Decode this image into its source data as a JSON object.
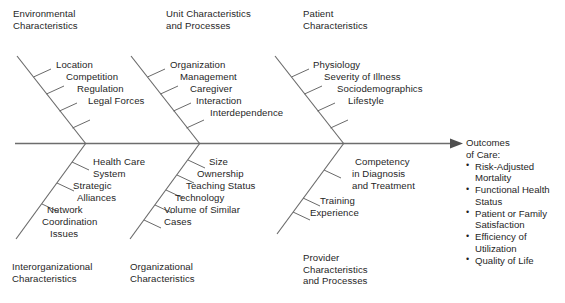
{
  "diagram": {
    "type": "ishikawa-fishbone",
    "line_color": "#6a6a6a",
    "text_color": "#1f1f1f",
    "background_color": "#ffffff"
  },
  "categories": [
    {
      "id": "environmental",
      "position": "top",
      "label_lines": [
        "Environmental",
        "Characteristics"
      ],
      "factor_lines": [
        "Location",
        "Competition",
        "Regulation",
        "Legal Forces"
      ]
    },
    {
      "id": "unit",
      "position": "top",
      "label_lines": [
        "Unit Characteristics",
        "and Processes"
      ],
      "factor_lines": [
        "Organization",
        "Management",
        "Caregiver",
        "Interaction",
        "Interdependence"
      ]
    },
    {
      "id": "patient",
      "position": "top",
      "label_lines": [
        "Patient",
        "Characteristics"
      ],
      "factor_lines": [
        "Physiology",
        "Severity of Illness",
        "Sociodemographics",
        "Lifestyle"
      ]
    },
    {
      "id": "interorganizational",
      "position": "bottom",
      "label_lines": [
        "Interorganizational",
        "Characteristics"
      ],
      "factor_lines": [
        "Health Care",
        "System",
        "Strategic",
        "Alliances",
        "Network",
        "Coordination",
        "Issues"
      ]
    },
    {
      "id": "organizational",
      "position": "bottom",
      "label_lines": [
        "Organizational",
        "Characteristics"
      ],
      "factor_lines": [
        "Size",
        "Ownership",
        "Teaching Status",
        "Technology",
        "Volume of Similar",
        "Cases"
      ]
    },
    {
      "id": "provider",
      "position": "bottom",
      "label_lines": [
        "Provider",
        "Characteristics",
        "and Processes"
      ],
      "factor_lines": [
        "Competency",
        "in Diagnosis",
        "and Treatment",
        "Training",
        "Experience"
      ]
    }
  ],
  "outcomes": {
    "heading_lines": [
      "Outcomes",
      "of Care:"
    ],
    "bullet_glyph": "•",
    "items": [
      "Risk-Adjusted Mortality",
      "Functional Health Status",
      "Patient or Family Satisfaction",
      "Efficiency of Utilization",
      "Quality of Life"
    ]
  }
}
